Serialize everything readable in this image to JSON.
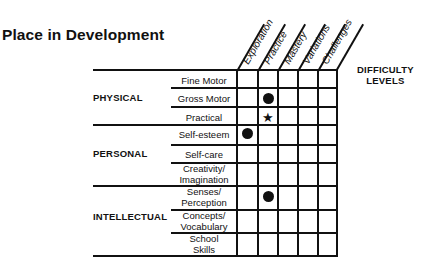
{
  "title": "Place in Development",
  "legend": {
    "line1": "DIFFICULTY",
    "line2": "LEVELS"
  },
  "columns": [
    "Exploration",
    "Practice",
    "Mastery",
    "Variations",
    "Challenges"
  ],
  "groups": [
    {
      "label": "PHYSICAL",
      "rows": [
        "Fine Motor",
        "Gross Motor",
        "Practical"
      ]
    },
    {
      "label": "PERSONAL",
      "rows": [
        "Self-esteem",
        "Self-care",
        "Creativity/ Imagination"
      ]
    },
    {
      "label": "INTELLECTUAL",
      "rows": [
        "Senses/ Perception",
        "Concepts/ Vocabulary",
        "School Skills"
      ]
    }
  ],
  "rows": {
    "fine_motor": "Fine Motor",
    "gross_motor": "Gross Motor",
    "practical": "Practical",
    "self_esteem": "Self-esteem",
    "self_care": "Self-care",
    "creativity_1": "Creativity/",
    "creativity_2": "Imagination",
    "senses_1": "Senses/",
    "senses_2": "Perception",
    "concepts_1": "Concepts/",
    "concepts_2": "Vocabulary",
    "school_1": "School",
    "school_2": "Skills"
  },
  "marks": [
    {
      "row": "Gross Motor",
      "column": "Practice",
      "symbol": "dot"
    },
    {
      "row": "Practical",
      "column": "Practice",
      "symbol": "star"
    },
    {
      "row": "Self-esteem",
      "column": "Exploration",
      "symbol": "dot"
    },
    {
      "row": "Senses/ Perception",
      "column": "Practice",
      "symbol": "dot"
    }
  ],
  "symbols": {
    "star": "★"
  }
}
